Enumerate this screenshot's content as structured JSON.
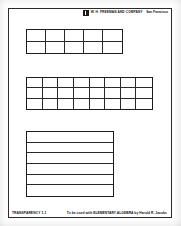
{
  "page": {
    "background_color": "#fdfdfd",
    "frame_color": "#2b2b2b",
    "ink_color": "#1d1d1d"
  },
  "header": {
    "logo_name": "wh-freeman-logo",
    "publisher": "W. H. FREEMAN AND COMPANY",
    "city": "San Francisco"
  },
  "figures": [
    {
      "id": "figure-1",
      "label": "rectangle-grid-5x2",
      "columns": 5,
      "rows": 2,
      "cells": 10
    },
    {
      "id": "figure-2",
      "label": "rectangle-grid-8x3",
      "columns": 8,
      "rows": 3,
      "cells": 24
    },
    {
      "id": "figure-3",
      "label": "square-strips-1x6",
      "columns": 1,
      "rows": 6,
      "cells": 6
    }
  ],
  "footer": {
    "transparency_id": "TRANSPARENCY 1-1",
    "credit": "To be used with ELEMENTARY ALGEBRA by Harold R. Jacobs"
  }
}
